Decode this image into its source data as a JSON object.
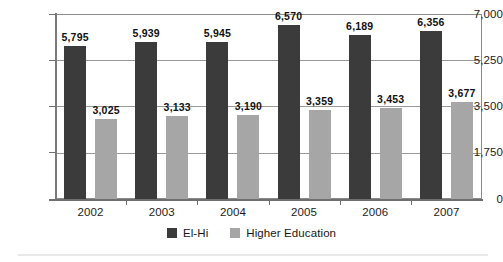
{
  "chart_data": {
    "type": "bar",
    "title": "",
    "subtitle": "",
    "xlabel": "",
    "ylabel": "",
    "categories": [
      "2002",
      "2003",
      "2004",
      "2005",
      "2006",
      "2007"
    ],
    "series": [
      {
        "name": "El-Hi",
        "color": "#3b3b3b",
        "values": [
          5795,
          5939,
          5945,
          6570,
          6189,
          6356
        ],
        "labels": [
          "5,795",
          "5,939",
          "5,945",
          "6,570",
          "6,189",
          "6,356"
        ]
      },
      {
        "name": "Higher Education",
        "color": "#a6a6a6",
        "values": [
          3025,
          3133,
          3190,
          3359,
          3453,
          3677
        ],
        "labels": [
          "3,025",
          "3,133",
          "3,190",
          "3,359",
          "3,453",
          "3,677"
        ]
      }
    ],
    "ylim": [
      0,
      7000
    ],
    "yticks": [
      0,
      1750,
      3500,
      5250,
      7000
    ],
    "ytick_labels": [
      "0",
      "1,750",
      "3,500",
      "5,250",
      "7,000"
    ],
    "grid": true,
    "grid_axis": "y",
    "legend_position": "bottom-center",
    "data_labels": true
  },
  "legend": {
    "items": [
      {
        "label": "El-Hi",
        "color": "#3b3b3b"
      },
      {
        "label": "Higher Education",
        "color": "#a6a6a6"
      }
    ]
  }
}
